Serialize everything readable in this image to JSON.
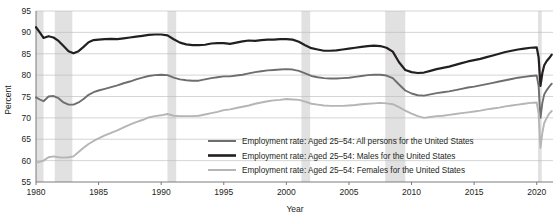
{
  "chart_data": {
    "type": "line",
    "title": "",
    "xlabel": "Year",
    "ylabel": "Percent",
    "xlim": [
      1980,
      2021.3
    ],
    "ylim": [
      55,
      95
    ],
    "grid": true,
    "legend_position": "inside-bottom-right",
    "yticks": [
      55,
      60,
      65,
      70,
      75,
      80,
      85,
      90,
      95
    ],
    "ytick_labels": [
      "55",
      "60",
      "65",
      "70",
      "75",
      "80",
      "85",
      "90",
      "95"
    ],
    "xticks": [
      1980,
      1985,
      1990,
      1995,
      2000,
      2005,
      2010,
      2015,
      2020
    ],
    "xtick_labels": [
      "1980",
      "1985",
      "1990",
      "1995",
      "2000",
      "2005",
      "2010",
      "2015",
      "2020"
    ],
    "shaded_regions": [
      {
        "name": "recession-1980",
        "start": 1980.0,
        "end": 1980.6
      },
      {
        "name": "recession-1981-82",
        "start": 1981.5,
        "end": 1982.9
      },
      {
        "name": "recession-1990-91",
        "start": 1990.5,
        "end": 1991.2
      },
      {
        "name": "recession-2001",
        "start": 2001.2,
        "end": 2001.9
      },
      {
        "name": "recession-2008-09",
        "start": 2007.9,
        "end": 2009.5
      },
      {
        "name": "recession-2020",
        "start": 2020.1,
        "end": 2020.4
      }
    ],
    "series": [
      {
        "name": "Employment rate: Aged 25–54: All persons for the United States",
        "color": "#6e6e6e",
        "width": 1.9,
        "x": [
          1980.0,
          1980.3,
          1980.6,
          1981.0,
          1981.4,
          1981.8,
          1982.2,
          1982.6,
          1983.0,
          1983.4,
          1983.8,
          1984.2,
          1984.6,
          1985.0,
          1985.5,
          1986.0,
          1986.5,
          1987.0,
          1987.5,
          1988.0,
          1988.5,
          1989.0,
          1989.5,
          1990.0,
          1990.5,
          1991.0,
          1991.5,
          1992.0,
          1992.5,
          1993.0,
          1993.5,
          1994.0,
          1994.5,
          1995.0,
          1995.5,
          1996.0,
          1996.5,
          1997.0,
          1997.5,
          1998.0,
          1998.5,
          1999.0,
          1999.5,
          2000.0,
          2000.5,
          2001.0,
          2001.5,
          2002.0,
          2002.5,
          2003.0,
          2003.5,
          2004.0,
          2004.5,
          2005.0,
          2005.5,
          2006.0,
          2006.5,
          2007.0,
          2007.5,
          2008.0,
          2008.5,
          2009.0,
          2009.5,
          2010.0,
          2010.5,
          2011.0,
          2011.5,
          2012.0,
          2012.5,
          2013.0,
          2013.5,
          2014.0,
          2014.5,
          2015.0,
          2015.5,
          2016.0,
          2016.5,
          2017.0,
          2017.5,
          2018.0,
          2018.5,
          2019.0,
          2019.5,
          2020.0,
          2020.15,
          2020.3,
          2020.45,
          2020.6,
          2020.8,
          2021.0,
          2021.2
        ],
        "y": [
          74.8,
          74.3,
          73.9,
          75.0,
          75.1,
          74.6,
          73.6,
          73.1,
          73.1,
          73.6,
          74.4,
          75.4,
          76.0,
          76.4,
          76.8,
          77.2,
          77.6,
          78.1,
          78.5,
          79.0,
          79.4,
          79.8,
          80.0,
          80.1,
          80.0,
          79.4,
          79.0,
          78.8,
          78.7,
          78.7,
          79.0,
          79.3,
          79.5,
          79.7,
          79.7,
          79.9,
          80.1,
          80.4,
          80.7,
          80.9,
          81.1,
          81.2,
          81.3,
          81.4,
          81.3,
          81.0,
          80.4,
          79.8,
          79.5,
          79.3,
          79.2,
          79.2,
          79.3,
          79.4,
          79.6,
          79.8,
          80.0,
          80.1,
          80.1,
          79.9,
          79.3,
          77.8,
          76.4,
          75.7,
          75.3,
          75.2,
          75.5,
          75.8,
          76.0,
          76.2,
          76.5,
          76.8,
          77.1,
          77.3,
          77.6,
          77.9,
          78.2,
          78.5,
          78.8,
          79.1,
          79.4,
          79.6,
          79.8,
          79.9,
          77.5,
          70.0,
          73.5,
          75.5,
          76.5,
          77.3,
          78.0
        ]
      },
      {
        "name": "Employment rate: Aged 25–54: Males for the United States",
        "color": "#231f20",
        "width": 2.2,
        "x": [
          1980.0,
          1980.3,
          1980.6,
          1981.0,
          1981.4,
          1981.8,
          1982.2,
          1982.6,
          1983.0,
          1983.4,
          1983.8,
          1984.2,
          1984.6,
          1985.0,
          1985.5,
          1986.0,
          1986.5,
          1987.0,
          1987.5,
          1988.0,
          1988.5,
          1989.0,
          1989.5,
          1990.0,
          1990.5,
          1991.0,
          1991.5,
          1992.0,
          1992.5,
          1993.0,
          1993.5,
          1994.0,
          1994.5,
          1995.0,
          1995.5,
          1996.0,
          1996.5,
          1997.0,
          1997.5,
          1998.0,
          1998.5,
          1999.0,
          1999.5,
          2000.0,
          2000.5,
          2001.0,
          2001.5,
          2002.0,
          2002.5,
          2003.0,
          2003.5,
          2004.0,
          2004.5,
          2005.0,
          2005.5,
          2006.0,
          2006.5,
          2007.0,
          2007.5,
          2008.0,
          2008.5,
          2009.0,
          2009.5,
          2010.0,
          2010.5,
          2011.0,
          2011.5,
          2012.0,
          2012.5,
          2013.0,
          2013.5,
          2014.0,
          2014.5,
          2015.0,
          2015.5,
          2016.0,
          2016.5,
          2017.0,
          2017.5,
          2018.0,
          2018.5,
          2019.0,
          2019.5,
          2020.0,
          2020.15,
          2020.3,
          2020.45,
          2020.6,
          2020.8,
          2021.0,
          2021.2
        ],
        "y": [
          91.2,
          90.0,
          88.7,
          89.1,
          88.8,
          88.0,
          86.8,
          85.6,
          85.1,
          85.6,
          86.6,
          87.7,
          88.2,
          88.3,
          88.4,
          88.5,
          88.4,
          88.6,
          88.8,
          89.0,
          89.2,
          89.4,
          89.5,
          89.5,
          89.3,
          88.4,
          87.6,
          87.2,
          87.0,
          87.0,
          87.1,
          87.4,
          87.5,
          87.5,
          87.3,
          87.6,
          87.9,
          88.1,
          88.0,
          88.2,
          88.3,
          88.3,
          88.4,
          88.4,
          88.3,
          87.8,
          87.0,
          86.3,
          86.0,
          85.7,
          85.7,
          85.8,
          86.0,
          86.2,
          86.4,
          86.6,
          86.8,
          86.9,
          86.8,
          86.4,
          85.5,
          83.0,
          81.2,
          80.7,
          80.5,
          80.6,
          81.0,
          81.4,
          81.7,
          82.0,
          82.4,
          82.8,
          83.2,
          83.5,
          83.8,
          84.2,
          84.6,
          85.0,
          85.4,
          85.7,
          86.0,
          86.2,
          86.4,
          86.5,
          84.2,
          77.5,
          80.5,
          82.3,
          83.3,
          84.0,
          84.8
        ]
      },
      {
        "name": "Employment rate: Aged 25–54: Females for the United States",
        "color": "#b5b5b5",
        "width": 1.9,
        "x": [
          1980.0,
          1980.3,
          1980.6,
          1981.0,
          1981.4,
          1981.8,
          1982.2,
          1982.6,
          1983.0,
          1983.4,
          1983.8,
          1984.2,
          1984.6,
          1985.0,
          1985.5,
          1986.0,
          1986.5,
          1987.0,
          1987.5,
          1988.0,
          1988.5,
          1989.0,
          1989.5,
          1990.0,
          1990.5,
          1991.0,
          1991.5,
          1992.0,
          1992.5,
          1993.0,
          1993.5,
          1994.0,
          1994.5,
          1995.0,
          1995.5,
          1996.0,
          1996.5,
          1997.0,
          1997.5,
          1998.0,
          1998.5,
          1999.0,
          1999.5,
          2000.0,
          2000.5,
          2001.0,
          2001.5,
          2002.0,
          2002.5,
          2003.0,
          2003.5,
          2004.0,
          2004.5,
          2005.0,
          2005.5,
          2006.0,
          2006.5,
          2007.0,
          2007.5,
          2008.0,
          2008.5,
          2009.0,
          2009.5,
          2010.0,
          2010.5,
          2011.0,
          2011.5,
          2012.0,
          2012.5,
          2013.0,
          2013.5,
          2014.0,
          2014.5,
          2015.0,
          2015.5,
          2016.0,
          2016.5,
          2017.0,
          2017.5,
          2018.0,
          2018.5,
          2019.0,
          2019.5,
          2020.0,
          2020.15,
          2020.3,
          2020.45,
          2020.6,
          2020.8,
          2021.0,
          2021.2
        ],
        "y": [
          59.5,
          59.7,
          60.0,
          60.8,
          61.0,
          60.8,
          60.7,
          60.8,
          61.0,
          62.0,
          63.0,
          63.9,
          64.6,
          65.2,
          65.9,
          66.5,
          67.1,
          67.8,
          68.4,
          69.0,
          69.5,
          70.1,
          70.4,
          70.6,
          70.9,
          70.5,
          70.4,
          70.4,
          70.4,
          70.5,
          70.8,
          71.1,
          71.4,
          71.8,
          72.0,
          72.3,
          72.6,
          72.9,
          73.3,
          73.6,
          73.9,
          74.1,
          74.2,
          74.4,
          74.3,
          74.2,
          73.8,
          73.3,
          73.1,
          72.9,
          72.8,
          72.8,
          72.8,
          72.9,
          73.0,
          73.2,
          73.3,
          73.4,
          73.5,
          73.4,
          73.2,
          72.5,
          71.7,
          71.0,
          70.4,
          70.0,
          70.2,
          70.4,
          70.5,
          70.7,
          70.9,
          71.1,
          71.3,
          71.5,
          71.7,
          72.0,
          72.2,
          72.4,
          72.7,
          72.9,
          73.1,
          73.3,
          73.5,
          73.6,
          71.0,
          63.0,
          66.5,
          68.8,
          70.0,
          71.0,
          71.6
        ]
      }
    ],
    "legend": [
      {
        "label": "Employment rate: Aged 25–54: All persons for the United States",
        "color": "#6e6e6e",
        "width": 2.0
      },
      {
        "label": "Employment rate: Aged 25–54: Males for the United States",
        "color": "#231f20",
        "width": 2.6
      },
      {
        "label": "Employment rate: Aged 25–54: Females for the United States",
        "color": "#b5b5b5",
        "width": 2.0
      }
    ]
  }
}
